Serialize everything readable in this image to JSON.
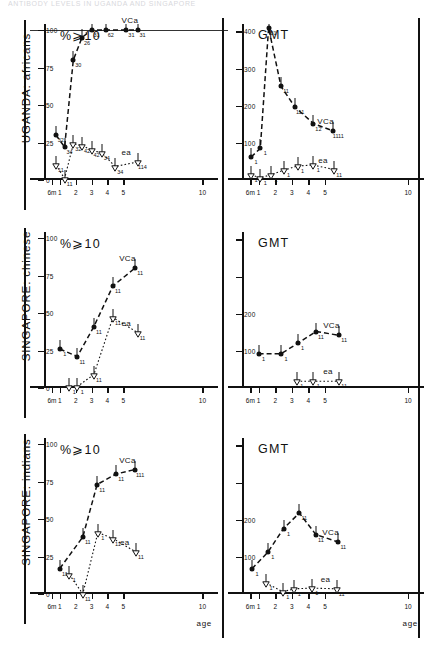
{
  "running_header": "ANTIBODY LEVELS IN UGANDA AND SINGAPORE",
  "figure": {
    "x_axis_label": "age",
    "x_ticks": [
      "6m",
      "1",
      "2",
      "3",
      "4",
      "5",
      "10"
    ],
    "x_tick_values": [
      0.5,
      1,
      2,
      3,
      4,
      5,
      10
    ],
    "percent_axis_title": "%⩾10",
    "gmt_axis_title": "GMT",
    "percent_y_ticks": [
      0,
      25,
      50,
      75,
      100
    ],
    "gmt_y_ticks": [
      100,
      200,
      300,
      400
    ],
    "series_labels": {
      "vca": "VCa",
      "ea": "ea"
    },
    "rows": [
      {
        "label": "UGANDA: africans"
      },
      {
        "label": "SINGAPORE: chinese"
      },
      {
        "label": "SINGAPORE: indians"
      }
    ]
  },
  "chart_data": [
    {
      "type": "line",
      "title": "UGANDA: africans — %⩾10",
      "panel": "percent",
      "population": "UGANDA: africans",
      "xlabel": "age",
      "ylabel": "%⩾10",
      "xlim": [
        0,
        10.6
      ],
      "ylim": [
        0,
        104
      ],
      "grid": false,
      "reference_line": 100,
      "series": [
        {
          "name": "VCa",
          "marker": "filled-circle",
          "linestyle": "dashed",
          "x": [
            0.75,
            1.3,
            1.85,
            2.4,
            3.0,
            3.9,
            5.2,
            5.9
          ],
          "values": [
            30,
            22,
            80,
            95,
            100,
            100,
            100,
            100
          ],
          "point_labels": [
            "32",
            "34",
            "30",
            "26",
            "31",
            "62",
            "31",
            "31"
          ]
        },
        {
          "name": "ea",
          "marker": "open-triangle",
          "linestyle": "dotted",
          "x": [
            0.75,
            1.3,
            1.85,
            2.4,
            3.0,
            3.65,
            4.5,
            5.9
          ],
          "values": [
            10,
            1,
            24,
            23,
            20,
            18,
            9,
            12
          ],
          "point_labels": [
            "11",
            "11",
            "32",
            "42",
            "42",
            "34",
            "34",
            "114"
          ]
        }
      ]
    },
    {
      "type": "line",
      "title": "UGANDA: africans — GMT",
      "panel": "gmt",
      "population": "UGANDA: africans",
      "xlabel": "age",
      "ylabel": "GMT",
      "xlim": [
        0,
        10.6
      ],
      "ylim": [
        0,
        420
      ],
      "grid": false,
      "series": [
        {
          "name": "VCa",
          "marker": "filled-circle",
          "linestyle": "dashed",
          "x": [
            0.55,
            1.1,
            1.6,
            2.35,
            3.2,
            4.3,
            5.5
          ],
          "values": [
            62,
            85,
            410,
            252,
            196,
            152,
            132
          ],
          "point_labels": [
            "1",
            "1",
            "31",
            "11",
            "111",
            "12",
            "1111"
          ]
        },
        {
          "name": "ea",
          "marker": "open-triangle",
          "linestyle": "dotted",
          "x": [
            0.55,
            1.1,
            1.75,
            2.5,
            3.35,
            4.3,
            5.55
          ],
          "values": [
            14,
            6,
            14,
            26,
            38,
            40,
            28
          ],
          "point_labels": [
            "1",
            "1",
            "1",
            "1",
            "1",
            "1",
            "11"
          ]
        }
      ]
    },
    {
      "type": "line",
      "title": "SINGAPORE: chinese — %⩾10",
      "panel": "percent",
      "population": "SINGAPORE: chinese",
      "xlabel": "age",
      "ylabel": "%⩾10",
      "xlim": [
        0,
        10.6
      ],
      "ylim": [
        0,
        104
      ],
      "grid": false,
      "series": [
        {
          "name": "VCa",
          "marker": "filled-circle",
          "linestyle": "dashed",
          "x": [
            1.0,
            2.1,
            3.15,
            4.35,
            5.75
          ],
          "values": [
            26,
            21,
            41,
            68,
            80
          ],
          "point_labels": [
            "1",
            "11",
            "11",
            "11",
            "11"
          ]
        },
        {
          "name": "ea",
          "marker": "open-triangle",
          "linestyle": "dotted",
          "x": [
            1.6,
            2.1,
            3.15,
            4.35,
            5.9
          ],
          "values": [
            1,
            1,
            9,
            47,
            37
          ],
          "point_labels": [
            "1",
            "1",
            "11",
            "11",
            "11"
          ]
        }
      ]
    },
    {
      "type": "line",
      "title": "SINGAPORE: chinese — GMT",
      "panel": "gmt",
      "population": "SINGAPORE: chinese",
      "xlabel": "age",
      "ylabel": "GMT",
      "xlim": [
        0,
        10.6
      ],
      "ylim": [
        0,
        420
      ],
      "grid": false,
      "series": [
        {
          "name": "VCa",
          "marker": "filled-circle",
          "linestyle": "dashed",
          "x": [
            1.0,
            2.35,
            3.35,
            4.45,
            5.85
          ],
          "values": [
            92,
            92,
            120,
            152,
            142
          ],
          "point_labels": [
            "1",
            "1",
            "1",
            "11",
            "11"
          ]
        },
        {
          "name": "ea",
          "marker": "open-triangle",
          "linestyle": "dotted",
          "x": [
            3.3,
            4.3,
            5.85
          ],
          "values": [
            18,
            18,
            18
          ],
          "point_labels": [
            "1",
            "1",
            "11"
          ]
        }
      ]
    },
    {
      "type": "line",
      "title": "SINGAPORE: indians — %⩾10",
      "panel": "percent",
      "population": "SINGAPORE: indians",
      "xlabel": "age",
      "ylabel": "%⩾10",
      "xlim": [
        0,
        10.6
      ],
      "ylim": [
        0,
        104
      ],
      "grid": false,
      "series": [
        {
          "name": "VCa",
          "marker": "filled-circle",
          "linestyle": "dashed",
          "x": [
            1.0,
            2.45,
            3.35,
            4.55,
            5.75
          ],
          "values": [
            17,
            38,
            73,
            80,
            83
          ],
          "point_labels": [
            "11",
            "11",
            "11",
            "11",
            "111"
          ]
        },
        {
          "name": "ea",
          "marker": "open-triangle",
          "linestyle": "dotted",
          "x": [
            1.6,
            2.45,
            3.4,
            4.35,
            5.8
          ],
          "values": [
            13,
            0,
            41,
            37,
            28
          ],
          "point_labels": [
            "1",
            "11",
            "1",
            "11",
            "11"
          ]
        }
      ]
    },
    {
      "type": "line",
      "title": "SINGAPORE: indians — GMT",
      "panel": "gmt",
      "population": "SINGAPORE: indians",
      "xlabel": "age",
      "ylabel": "GMT",
      "xlim": [
        0,
        10.6
      ],
      "ylim": [
        0,
        420
      ],
      "grid": false,
      "series": [
        {
          "name": "VCa",
          "marker": "filled-circle",
          "linestyle": "dashed",
          "x": [
            0.6,
            1.55,
            2.5,
            3.45,
            4.45,
            5.8
          ],
          "values": [
            68,
            112,
            176,
            218,
            160,
            140
          ],
          "point_labels": [
            "1",
            "1",
            "1",
            "11",
            "11",
            "11"
          ]
        },
        {
          "name": "ea",
          "marker": "open-triangle",
          "linestyle": "dotted",
          "x": [
            1.45,
            2.45,
            3.15,
            4.2,
            5.7
          ],
          "values": [
            30,
            6,
            14,
            16,
            14
          ],
          "point_labels": [
            "1",
            "1",
            "1",
            "1",
            "11"
          ]
        }
      ]
    }
  ]
}
